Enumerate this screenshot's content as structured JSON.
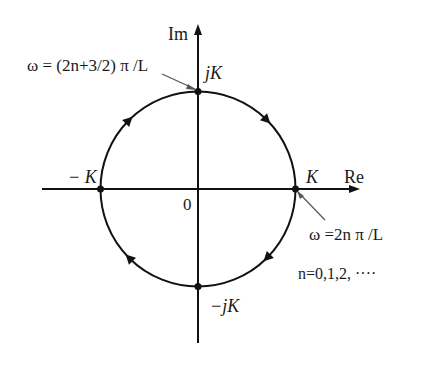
{
  "diagram": {
    "type": "complex-plane-locus",
    "axes": {
      "real_label": "Re",
      "imag_label": "Im",
      "origin_label": "0"
    },
    "points": {
      "pos_real": "K",
      "neg_real": "− K",
      "pos_imag": "jK",
      "neg_imag": "−jK"
    },
    "annotations": {
      "top": "ω = (2n+3/2) π /L",
      "right": "ω =2n π /L",
      "n_values": "n=0,1,2, ····"
    },
    "direction": "clockwise",
    "colors": {
      "line": "#111111",
      "leader": "#555555",
      "background": "#ffffff"
    }
  }
}
